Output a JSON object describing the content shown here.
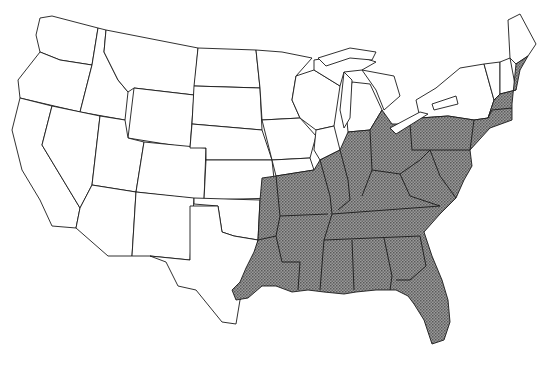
{
  "map": {
    "title": "",
    "region": "Contiguous United States",
    "fill_color": "#8a8a8a",
    "border_color": "#1a1a1a",
    "background_color": "#ffffff",
    "shaded_pattern": "stippled gray",
    "shaded_region_label": "Eastern / southeastern range",
    "legend": []
  }
}
